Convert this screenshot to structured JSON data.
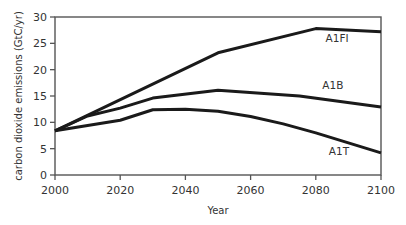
{
  "chart_data": {
    "type": "line",
    "title": "",
    "xlabel": "Year",
    "ylabel": "carbon dioxide emissions (GtC/yr)",
    "xlim": [
      2000,
      2100
    ],
    "ylim": [
      0,
      30
    ],
    "x_ticks": [
      "2000",
      "2020",
      "2040",
      "2060",
      "2080",
      "2100"
    ],
    "y_ticks": [
      "0",
      "5",
      "10",
      "15",
      "20",
      "25",
      "30"
    ],
    "grid": false,
    "legend": "inline labels",
    "series": [
      {
        "name": "A1FI",
        "x": [
          2000,
          2050,
          2080,
          2100
        ],
        "values": [
          8.4,
          23.2,
          27.8,
          27.2
        ],
        "label_pos": [
          2083,
          25.2
        ]
      },
      {
        "name": "A1B",
        "x": [
          2000,
          2010,
          2020,
          2030,
          2050,
          2075,
          2100
        ],
        "values": [
          8.4,
          11.2,
          12.7,
          14.6,
          16.1,
          15.0,
          12.9
        ],
        "label_pos": [
          2082,
          16.3
        ]
      },
      {
        "name": "A1T",
        "x": [
          2000,
          2020,
          2030,
          2040,
          2050,
          2060,
          2070,
          2080,
          2100
        ],
        "values": [
          8.4,
          10.4,
          12.4,
          12.5,
          12.1,
          11.1,
          9.7,
          8.0,
          4.2
        ],
        "label_pos": [
          2084,
          3.8
        ]
      }
    ]
  }
}
